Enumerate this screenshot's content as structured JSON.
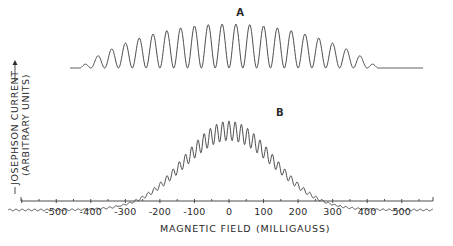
{
  "chart_data": {
    "type": "line",
    "title": "",
    "xlabel": "MAGNETIC FIELD",
    "xlabel_units": "(MILLIGAUSS)",
    "ylabel_line1": "JOSEPHSON CURRENT",
    "ylabel_line2": "(ARBITRARY UNITS)",
    "xlim": [
      -600,
      590
    ],
    "x_ticks": [
      -500,
      -400,
      -300,
      -200,
      -100,
      0,
      100,
      200,
      300,
      400,
      500
    ],
    "x_tick_labels": [
      "-500",
      "-400",
      "-300",
      "-200",
      "-100",
      "0",
      "100",
      "200",
      "300",
      "400",
      "500"
    ],
    "minor_tick_step": 50,
    "grid": false,
    "legend": "none",
    "series": [
      {
        "name": "A",
        "description": "Interference pattern, oscillation period ~40 mG, broad envelope extending to about ±450 mG",
        "x_range": [
          -460,
          560
        ],
        "period_mG": 40,
        "envelope_halfwidth_mG": 430,
        "peak_relative_height": 1.0,
        "peaks": [
          {
            "x": -420,
            "y": 0.08
          },
          {
            "x": -380,
            "y": 0.22
          },
          {
            "x": -340,
            "y": 0.36
          },
          {
            "x": -300,
            "y": 0.48
          },
          {
            "x": -260,
            "y": 0.58
          },
          {
            "x": -220,
            "y": 0.68
          },
          {
            "x": -180,
            "y": 0.76
          },
          {
            "x": -140,
            "y": 0.83
          },
          {
            "x": -100,
            "y": 0.89
          },
          {
            "x": -60,
            "y": 0.95
          },
          {
            "x": -20,
            "y": 0.99
          },
          {
            "x": 20,
            "y": 1.0
          },
          {
            "x": 60,
            "y": 0.97
          },
          {
            "x": 100,
            "y": 0.92
          },
          {
            "x": 140,
            "y": 0.86
          },
          {
            "x": 180,
            "y": 0.78
          },
          {
            "x": 220,
            "y": 0.7
          },
          {
            "x": 260,
            "y": 0.6
          },
          {
            "x": 300,
            "y": 0.49
          },
          {
            "x": 340,
            "y": 0.37
          },
          {
            "x": 380,
            "y": 0.23
          },
          {
            "x": 420,
            "y": 0.09
          }
        ]
      },
      {
        "name": "B",
        "description": "Interference pattern with fast oscillation (~18 mG period) under a Gaussian-like envelope, nonzero between about -320 and +320 mG",
        "x_range": [
          -600,
          590
        ],
        "period_mG": 18,
        "envelope_center_mG": 0,
        "envelope_sigma_mG": 130,
        "peak_relative_height": 1.0,
        "min_to_max_ratio_at_center": 0.78
      }
    ],
    "annotations": [
      {
        "text": "A",
        "x": 30,
        "series": "A"
      },
      {
        "text": "B",
        "x": 145,
        "series": "B"
      }
    ]
  },
  "layout": {
    "px_per_mG": 0.3455,
    "zero_x": 229,
    "axis_y": 201,
    "axis_x_start": 21,
    "axis_x_end": 433,
    "curveA": {
      "baseline_y": 68,
      "peak_y": 24,
      "x_start_px": 70,
      "x_end_px": 423
    },
    "curveB": {
      "baseline_y": 210,
      "peak_y": 121,
      "x_start_px": 8,
      "x_end_px": 433
    }
  }
}
